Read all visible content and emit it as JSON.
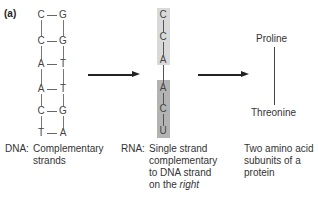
{
  "panel_label": "(a)",
  "dna": {
    "pairs": [
      {
        "left": "C",
        "right": "G"
      },
      {
        "left": "C",
        "right": "G"
      },
      {
        "left": "A",
        "right": "T"
      },
      {
        "left": "A",
        "right": "T"
      },
      {
        "left": "C",
        "right": "G"
      },
      {
        "left": "T",
        "right": "A"
      }
    ],
    "caption_prefix": "DNA:",
    "caption_line1": "Complementary",
    "caption_line2": "strands"
  },
  "rna": {
    "bases": [
      "C",
      "C",
      "A",
      "A",
      "C",
      "U"
    ],
    "caption_prefix": "RNA:",
    "caption_line1": "Single strand",
    "caption_line2": "complementary",
    "caption_line3": "to DNA strand",
    "caption_line4_plain": "on the ",
    "caption_line4_italic": "right",
    "colors": {
      "codon1_box": "#d9d9d9",
      "codon2_box": "#b3b3b3"
    }
  },
  "protein": {
    "amino_acid_top": "Proline",
    "amino_acid_bottom": "Threonine",
    "caption_line1": "Two amino acid",
    "caption_line2": "subunits of a",
    "caption_line3": "protein"
  }
}
